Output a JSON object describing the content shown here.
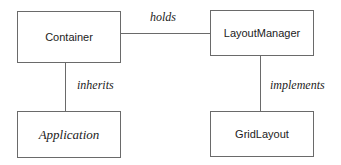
{
  "diagram": {
    "type": "class-relationship",
    "nodes": [
      {
        "id": "container",
        "label": "Container",
        "abstract": false
      },
      {
        "id": "layoutmanager",
        "label": "LayoutManager",
        "abstract": false
      },
      {
        "id": "application",
        "label": "Application",
        "abstract": true
      },
      {
        "id": "gridlayout",
        "label": "GridLayout",
        "abstract": false
      }
    ],
    "edges": [
      {
        "from": "container",
        "to": "layoutmanager",
        "label": "holds"
      },
      {
        "from": "container",
        "to": "application",
        "label": "inherits"
      },
      {
        "from": "layoutmanager",
        "to": "gridlayout",
        "label": "implements"
      }
    ],
    "colors": {
      "stroke": "#6a6a6a",
      "text": "#222222",
      "background": "#ffffff"
    }
  }
}
